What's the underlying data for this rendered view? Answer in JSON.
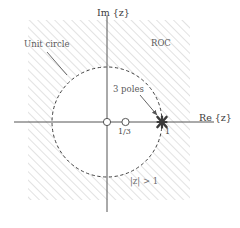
{
  "figure": {
    "type": "z-plane-roc-diagram",
    "width": 240,
    "height": 228,
    "background": "#ffffff"
  },
  "axes": {
    "imaginary_label": "Im {z}",
    "real_label": "Re {z}",
    "origin_px": [
      107,
      122
    ],
    "stroke": "#555555"
  },
  "unit_circle": {
    "label": "Unit circle",
    "radius_px": 55,
    "style": "dashed",
    "stroke": "#3f3f3f"
  },
  "roc": {
    "label": "ROC",
    "region_label": "|z| > 1",
    "hatch_color": "#c9c9c9",
    "hatch_angle_deg": 45,
    "description": "exterior of unit circle"
  },
  "markers": {
    "poles_label": "3 poles",
    "poles": [
      {
        "name": "triple-pole",
        "value": "1",
        "x": 1.0,
        "y": 0.0,
        "multiplicity": 3,
        "glyph": "x"
      }
    ],
    "zeros": [
      {
        "name": "zero-origin",
        "value": "",
        "x": 0.0,
        "y": 0.0,
        "glyph": "o"
      },
      {
        "name": "zero-one-third",
        "value": "1/3",
        "x": 0.3333,
        "y": 0.0,
        "glyph": "o"
      }
    ],
    "tick_labels": [
      "1/3",
      "1"
    ]
  }
}
